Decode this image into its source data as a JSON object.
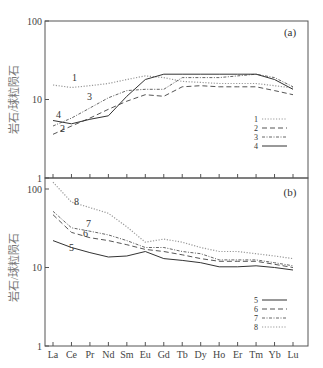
{
  "chart_data": [
    {
      "type": "line",
      "panel": "(a)",
      "title": "",
      "xlabel": "",
      "ylabel": "岩石/球粒陨石",
      "yscale": "log",
      "ylim": [
        1,
        100
      ],
      "yticks": [
        "1",
        "10",
        "100"
      ],
      "grid": false,
      "legend_position": "right-middle",
      "categories": [
        "La",
        "Ce",
        "Pr",
        "Nd",
        "Sm",
        "Eu",
        "Gd",
        "Tb",
        "Dy",
        "Ho",
        "Er",
        "Tm",
        "Yb",
        "Lu"
      ],
      "series": [
        {
          "name": "1",
          "style": "dotted",
          "color": "#999999",
          "values": [
            15.3,
            14.2,
            15,
            16,
            18,
            20,
            19,
            17,
            16.5,
            16,
            16,
            16,
            15,
            14
          ]
        },
        {
          "name": "2",
          "style": "long-dash",
          "color": "#555555",
          "values": [
            3.6,
            4.6,
            5.8,
            7.5,
            9.5,
            11.5,
            11,
            14.5,
            15,
            14.5,
            14.5,
            14.5,
            13,
            11.5
          ]
        },
        {
          "name": "3",
          "style": "dash-dot",
          "color": "#666666",
          "values": [
            4.6,
            5.8,
            7.8,
            10.5,
            13,
            13.5,
            13.5,
            19,
            19,
            19,
            20,
            21,
            19,
            14.5
          ]
        },
        {
          "name": "4",
          "style": "solid",
          "color": "#333333",
          "values": [
            5.4,
            4.9,
            5.6,
            6.2,
            11,
            18,
            21,
            21,
            21,
            21,
            21,
            21,
            18,
            13.5
          ]
        }
      ],
      "annotations": [
        {
          "text": "(a)",
          "position": "top-right"
        }
      ]
    },
    {
      "type": "line",
      "panel": "(b)",
      "title": "",
      "xlabel": "",
      "ylabel": "岩石/球粒陨石",
      "yscale": "log",
      "ylim": [
        1,
        100
      ],
      "yticks": [
        "1",
        "10",
        "100"
      ],
      "grid": false,
      "legend_position": "right-bottom",
      "categories": [
        "La",
        "Ce",
        "Pr",
        "Nd",
        "Sm",
        "Eu",
        "Gd",
        "Tb",
        "Dy",
        "Ho",
        "Er",
        "Tm",
        "Yb",
        "Lu"
      ],
      "series": [
        {
          "name": "5",
          "style": "solid",
          "color": "#333333",
          "values": [
            22,
            18,
            15.5,
            13.6,
            14,
            16,
            13,
            12.3,
            11.5,
            10.2,
            10.2,
            10.5,
            10,
            9.3
          ]
        },
        {
          "name": "6",
          "style": "long-dash",
          "color": "#555555",
          "values": [
            47,
            28,
            24,
            22,
            19.5,
            17,
            16,
            14.5,
            13,
            12,
            12,
            12,
            11,
            10
          ]
        },
        {
          "name": "7",
          "style": "dash-dot",
          "color": "#666666",
          "values": [
            52,
            32,
            29,
            26,
            22,
            18,
            18,
            16,
            15,
            12.5,
            12.5,
            12.5,
            11.5,
            10.5
          ]
        },
        {
          "name": "8",
          "style": "dotted",
          "color": "#999999",
          "values": [
            122,
            68,
            58,
            49,
            33,
            21,
            23,
            21,
            18,
            16,
            16,
            15,
            14,
            13
          ]
        }
      ],
      "annotations": [
        {
          "text": "(b)",
          "position": "top-right"
        }
      ]
    }
  ],
  "labels": {
    "panel_a": "(a)",
    "panel_b": "(b)",
    "ylabel": "岩石/球粒陨石",
    "ytick_100": "100",
    "ytick_10": "10",
    "ytick_1": "1"
  }
}
